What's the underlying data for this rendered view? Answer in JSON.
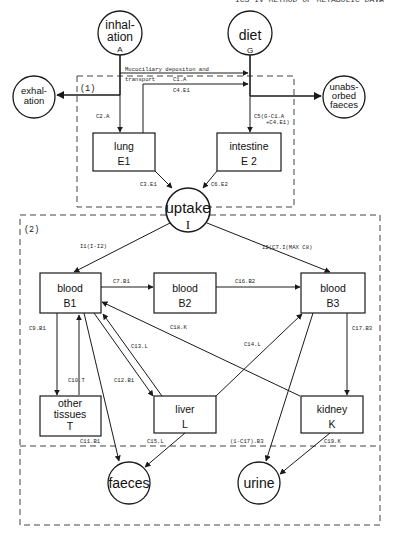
{
  "header": {
    "running_title": "ICS IV  METHOD OF METABOLIC DATA",
    "page_number": "7/"
  },
  "sections": {
    "s1": "(1)",
    "s2": "(2)"
  },
  "nodes": {
    "inhalation": {
      "line1": "inhal-",
      "line2": "ation",
      "symbol": "A"
    },
    "diet": {
      "label": "diet",
      "symbol": "G"
    },
    "exhalation": {
      "line1": "exhal-",
      "line2": "ation"
    },
    "unabsorbed": {
      "line1": "unabs-",
      "line2": "orbed",
      "line3": "faeces"
    },
    "lung": {
      "label": "lung",
      "symbol": "E1"
    },
    "intestine": {
      "label": "intestine",
      "symbol": "E 2"
    },
    "uptake": {
      "label": "uptake",
      "symbol": "I"
    },
    "blood_b1": {
      "label": "blood",
      "symbol": "B1"
    },
    "blood_b2": {
      "label": "blood",
      "symbol": "B2"
    },
    "blood_b3": {
      "label": "blood",
      "symbol": "B3"
    },
    "other_tissues": {
      "line1": "other",
      "line2": "tissues",
      "symbol": "T"
    },
    "liver": {
      "label": "liver",
      "symbol": "L"
    },
    "kidney": {
      "label": "kidney",
      "symbol": "K"
    },
    "faeces": {
      "label": "faeces"
    },
    "urine": {
      "label": "urine"
    }
  },
  "flow_labels": {
    "mucociliary_1": "Mucociliary depositon and",
    "mucociliary_2": "transport",
    "c1": "C1.A",
    "c4": "C4.E1",
    "c2": "C2.A",
    "c5_1": "C5(G-C1.A",
    "c5_2": "+C4.E1)",
    "c3": "C3.E1",
    "c6": "C6.E2",
    "i1": "I1(I-I2)",
    "i2": "I2(C7.I(MAX C8)",
    "c7": "C7.B1",
    "c16": "C16.B2",
    "c9": "C9.B1",
    "c18": "C18.K",
    "c13": "C13.L",
    "c14": "C14.L",
    "c17": "C17.B3",
    "c10": "C10.T",
    "c12": "C12.B1",
    "c11": "C11.B1",
    "c15": "C15.L",
    "c17b": "(1-C17).B3",
    "c19": "C19.K"
  }
}
